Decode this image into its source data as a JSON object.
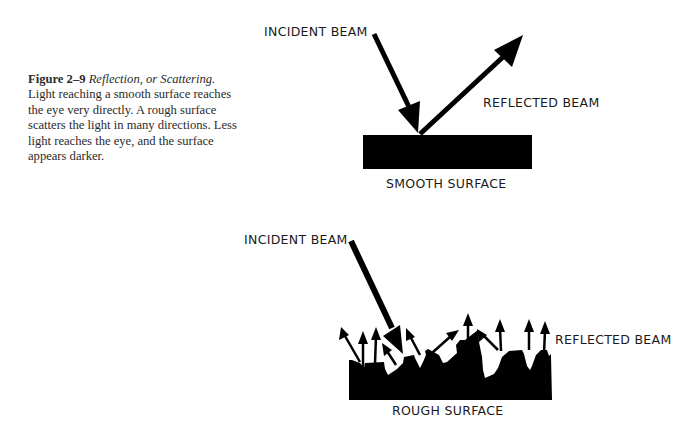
{
  "caption": {
    "figure_label": "Figure 2–9",
    "figure_title": "Reflection, or Scattering.",
    "body": "Light reaching a smooth surface reaches the eye very directly. A rough surface scatters the light in many directions. Less light reaches the eye, and the surface appears darker."
  },
  "smooth_diagram": {
    "incident_label": "INCIDENT BEAM",
    "reflected_label": "REFLECTED BEAM",
    "surface_label": "SMOOTH SURFACE"
  },
  "rough_diagram": {
    "incident_label": "INCIDENT BEAM",
    "reflected_label": "REFLECTED BEAM",
    "surface_label": "ROUGH SURFACE"
  },
  "colors": {
    "ink": "#000000",
    "text": "#1a1a1a",
    "background": "#ffffff"
  }
}
